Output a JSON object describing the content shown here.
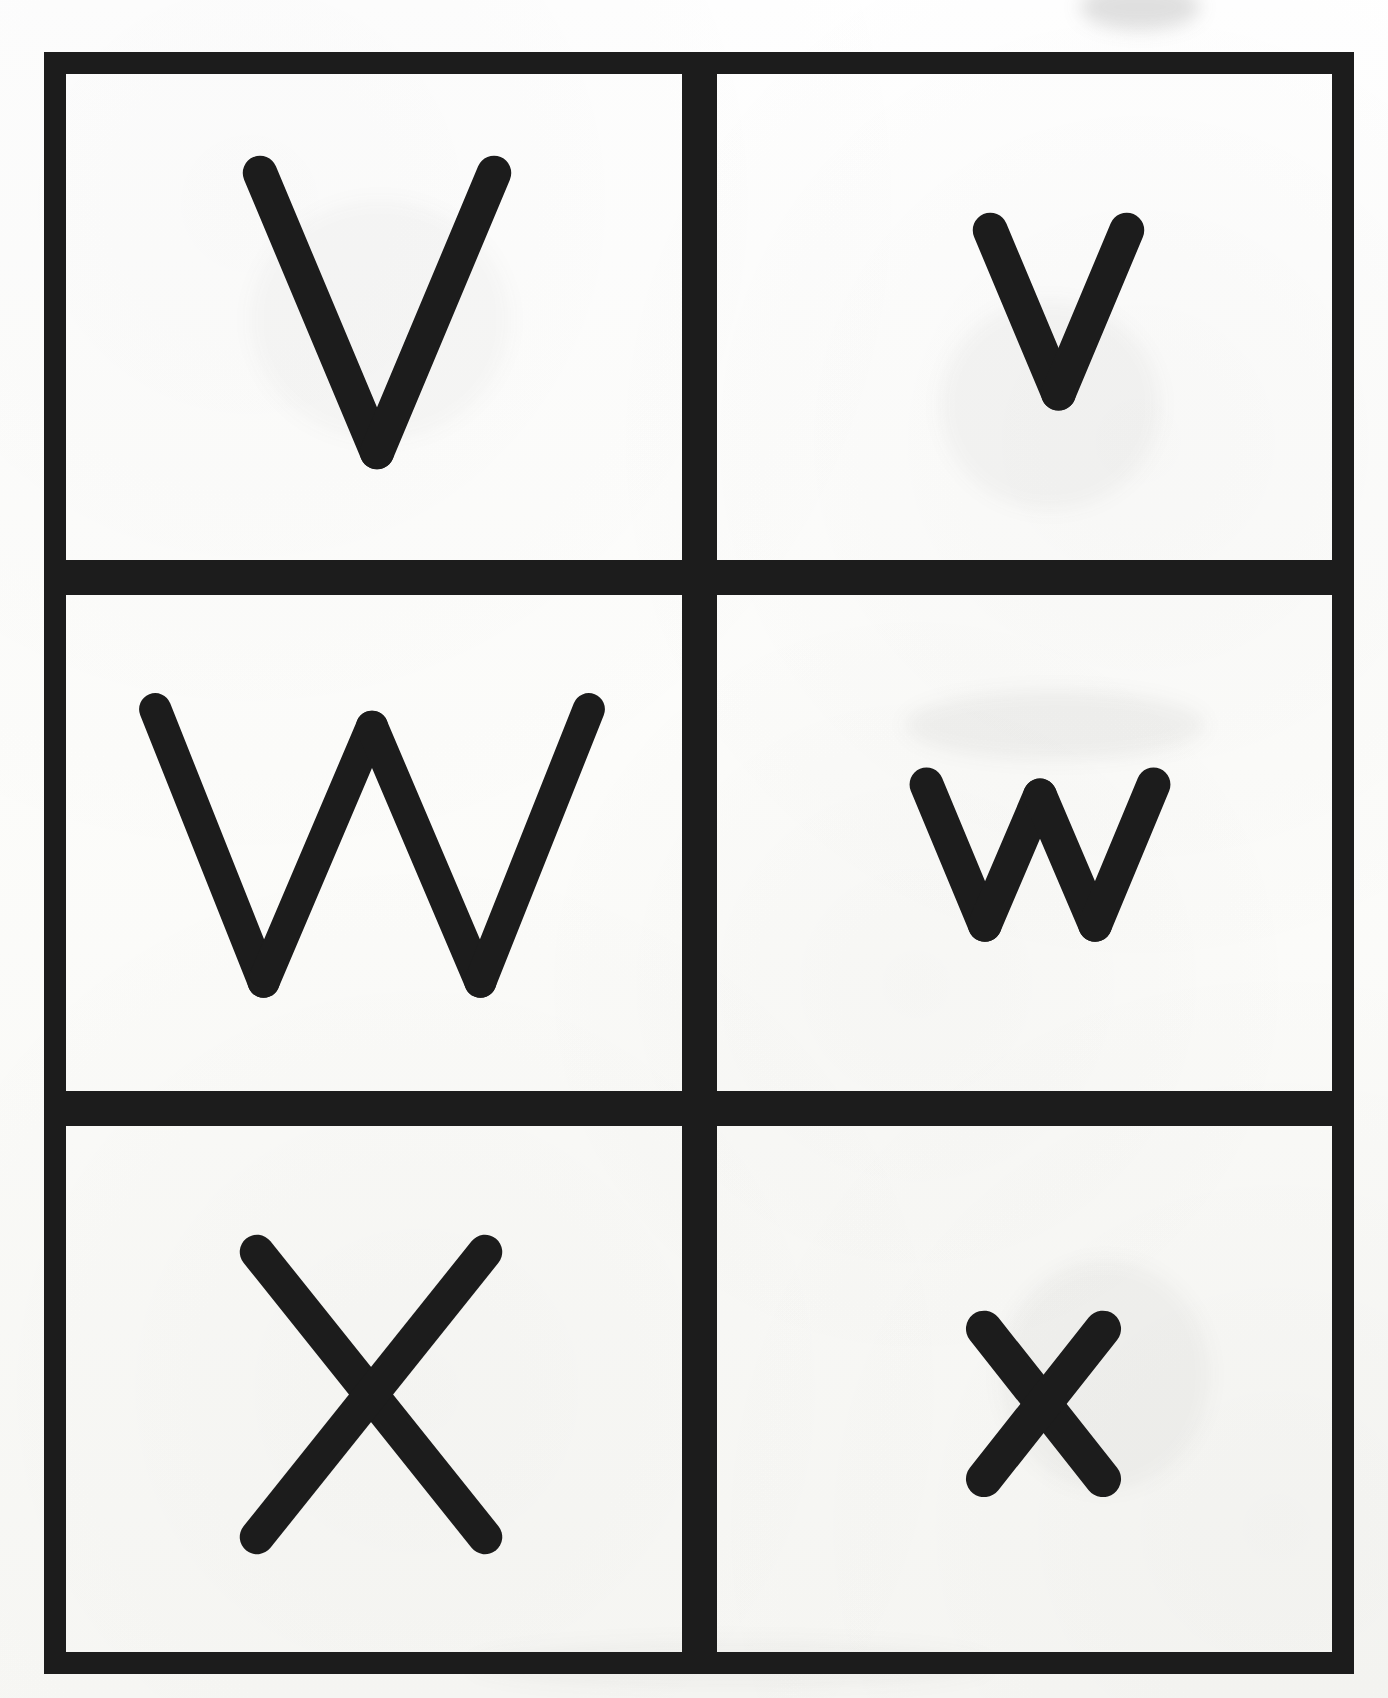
{
  "page": {
    "kind": "handwriting-practice-worksheet",
    "paper_color": "#fbfbf9",
    "ink_color": "#1c1c1c",
    "frame": {
      "border_color": "#1c1c1c",
      "border_thickness_px": 22,
      "divider_thickness_px": 35
    }
  },
  "grid": {
    "columns": 2,
    "rows": 3,
    "column_roles": [
      "uppercase",
      "lowercase"
    ],
    "cells": [
      {
        "id": "cell-v-upper",
        "row": 1,
        "column": 1,
        "letter": "V",
        "letter_case": "uppercase",
        "letter_name": "letter-v-uppercase",
        "size": "large",
        "stroke_width": 34
      },
      {
        "id": "cell-v-lower",
        "row": 1,
        "column": 2,
        "letter": "v",
        "letter_case": "lowercase",
        "letter_name": "letter-v-lowercase",
        "size": "small",
        "stroke_width": 34
      },
      {
        "id": "cell-w-upper",
        "row": 2,
        "column": 1,
        "letter": "W",
        "letter_case": "uppercase",
        "letter_name": "letter-w-uppercase",
        "size": "large",
        "stroke_width": 34
      },
      {
        "id": "cell-w-lower",
        "row": 2,
        "column": 2,
        "letter": "w",
        "letter_case": "lowercase",
        "letter_name": "letter-w-lowercase",
        "size": "small",
        "stroke_width": 34
      },
      {
        "id": "cell-x-upper",
        "row": 3,
        "column": 1,
        "letter": "X",
        "letter_case": "uppercase",
        "letter_name": "letter-x-uppercase",
        "size": "large",
        "stroke_width": 34
      },
      {
        "id": "cell-x-lower",
        "row": 3,
        "column": 2,
        "letter": "x",
        "letter_case": "lowercase",
        "letter_name": "letter-x-lowercase",
        "size": "small",
        "stroke_width": 34
      }
    ]
  },
  "scan_artifacts": {
    "description": "faint gray photocopy smudges on the paper background",
    "marks": [
      {
        "x": 940,
        "y": 300,
        "w": 220,
        "h": 210,
        "opacity": 0.045
      },
      {
        "x": 905,
        "y": 690,
        "w": 300,
        "h": 70,
        "opacity": 0.055
      },
      {
        "x": 1000,
        "y": 1260,
        "w": 210,
        "h": 230,
        "opacity": 0.04
      },
      {
        "x": 1080,
        "y": 10,
        "w": 120,
        "h": 40,
        "opacity": 0.06
      },
      {
        "x": 470,
        "y": 1640,
        "w": 520,
        "h": 50,
        "opacity": 0.035
      },
      {
        "x": 250,
        "y": 200,
        "w": 260,
        "h": 240,
        "opacity": 0.03
      }
    ]
  }
}
